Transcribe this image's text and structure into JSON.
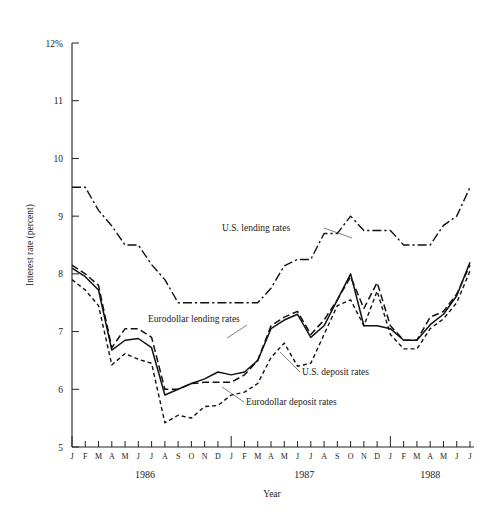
{
  "chart_data": {
    "type": "line",
    "title": "",
    "xlabel": "Year",
    "ylabel": "Interest rate (percent)",
    "ylim": [
      5,
      12
    ],
    "ytick_values": [
      5,
      6,
      7,
      8,
      9,
      10,
      11,
      12
    ],
    "ytick_labels": [
      "5",
      "6",
      "7",
      "8",
      "9",
      "10",
      "11",
      "12%"
    ],
    "grid": false,
    "legend_position": "inline-annotations",
    "x": [
      "J",
      "F",
      "M",
      "A",
      "M",
      "J",
      "J",
      "A",
      "S",
      "O",
      "N",
      "D",
      "J",
      "F",
      "M",
      "A",
      "M",
      "J",
      "J",
      "A",
      "S",
      "O",
      "N",
      "D",
      "J",
      "F",
      "M",
      "A",
      "M",
      "J",
      "J"
    ],
    "x_months": [
      "1986-01",
      "1986-02",
      "1986-03",
      "1986-04",
      "1986-05",
      "1986-06",
      "1986-07",
      "1986-08",
      "1986-09",
      "1986-10",
      "1986-11",
      "1986-12",
      "1987-01",
      "1987-02",
      "1987-03",
      "1987-04",
      "1987-05",
      "1987-06",
      "1987-07",
      "1987-08",
      "1987-09",
      "1987-10",
      "1987-11",
      "1987-12",
      "1988-01",
      "1988-02",
      "1988-03",
      "1988-04",
      "1988-05",
      "1988-06",
      "1988-07"
    ],
    "year_groups": [
      {
        "label": "1986",
        "start_index": 0,
        "end_index": 11
      },
      {
        "label": "1987",
        "start_index": 12,
        "end_index": 23
      },
      {
        "label": "1988",
        "start_index": 24,
        "end_index": 30
      }
    ],
    "series": [
      {
        "name": "U.S. lending rates",
        "style": "dash-dot",
        "label_anchor_index": 17,
        "values": [
          9.5,
          9.5,
          9.1,
          8.83,
          8.5,
          8.5,
          8.16,
          7.9,
          7.5,
          7.5,
          7.5,
          7.5,
          7.5,
          7.5,
          7.5,
          7.75,
          8.14,
          8.25,
          8.25,
          8.7,
          8.7,
          9.0,
          8.75,
          8.75,
          8.75,
          8.5,
          8.5,
          8.5,
          8.84,
          9.0,
          9.5
        ]
      },
      {
        "name": "Eurodollar lending rates",
        "style": "long-dash",
        "label_anchor_index": 5,
        "values": [
          8.15,
          8.0,
          7.8,
          6.72,
          7.05,
          7.05,
          6.9,
          6.0,
          6.0,
          6.1,
          6.12,
          6.12,
          6.12,
          6.25,
          6.5,
          7.1,
          7.25,
          7.35,
          6.95,
          7.2,
          7.55,
          7.95,
          7.4,
          7.85,
          7.1,
          6.85,
          6.85,
          7.25,
          7.35,
          7.65,
          8.15
        ]
      },
      {
        "name": "U.S. deposit rates",
        "style": "solid",
        "label_anchor_index": 18,
        "values": [
          8.1,
          7.95,
          7.72,
          6.68,
          6.85,
          6.88,
          6.72,
          5.9,
          6.0,
          6.1,
          6.18,
          6.3,
          6.25,
          6.3,
          6.5,
          7.05,
          7.2,
          7.3,
          6.9,
          7.1,
          7.55,
          8.0,
          7.1,
          7.1,
          7.05,
          6.85,
          6.85,
          7.12,
          7.3,
          7.62,
          8.2
        ]
      },
      {
        "name": "Eurodollar deposit rates",
        "style": "short-dash",
        "label_anchor_index": 12,
        "values": [
          7.9,
          7.72,
          7.45,
          6.42,
          6.62,
          6.52,
          6.45,
          5.42,
          5.55,
          5.5,
          5.7,
          5.72,
          5.9,
          5.95,
          6.1,
          6.55,
          6.8,
          6.4,
          6.45,
          6.95,
          7.45,
          7.55,
          7.1,
          7.7,
          6.95,
          6.7,
          6.7,
          7.05,
          7.22,
          7.5,
          8.05
        ]
      }
    ]
  }
}
